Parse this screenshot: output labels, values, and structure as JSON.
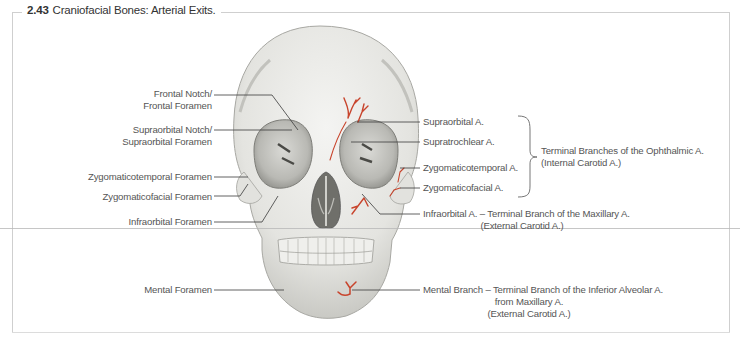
{
  "figure": {
    "number": "2.43",
    "title": "Craniofacial Bones: Arterial Exits."
  },
  "left_labels": [
    {
      "id": "frontal",
      "lines": [
        "Frontal Notch/",
        "Frontal Foramen"
      ]
    },
    {
      "id": "supraorbital",
      "lines": [
        "Supraorbital Notch/",
        "Supraorbital Foramen"
      ]
    },
    {
      "id": "zygomaticotemporal",
      "lines": [
        "Zygomaticotemporal Foramen"
      ]
    },
    {
      "id": "zygomaticofacial",
      "lines": [
        "Zygomaticofacial Foramen"
      ]
    },
    {
      "id": "infraorbital",
      "lines": [
        "Infraorbital Foramen"
      ]
    },
    {
      "id": "mental",
      "lines": [
        "Mental Foramen"
      ]
    }
  ],
  "right_labels": [
    {
      "id": "supraorbital_a",
      "text": "Supraorbital A."
    },
    {
      "id": "supratrochlear_a",
      "text": "Supratrochlear A."
    },
    {
      "id": "zygomaticotemporal_a",
      "text": "Zygomaticotemporal A."
    },
    {
      "id": "zygomaticofacial_a",
      "text": "Zygomaticofacial A."
    }
  ],
  "bracket_label": {
    "lines": [
      "Terminal Branches of the Ophthalmic A.",
      "(Internal Carotid A.)"
    ]
  },
  "infraorbital_artery": {
    "lines": [
      "Infraorbital A. – Terminal Branch of the Maxillary A.",
      "(External Carotid A.)"
    ]
  },
  "mental_branch": {
    "lines": [
      "Mental Branch – Terminal Branch of the Inferior Alveolar A.",
      "from Maxillary A.",
      "(External Carotid A.)"
    ]
  },
  "colors": {
    "artery": "#c8442c",
    "bone": "#e9e9e6",
    "bone_shadow": "#9a9a96",
    "leader": "#3a3a3a",
    "frame": "#cfcfcf"
  }
}
